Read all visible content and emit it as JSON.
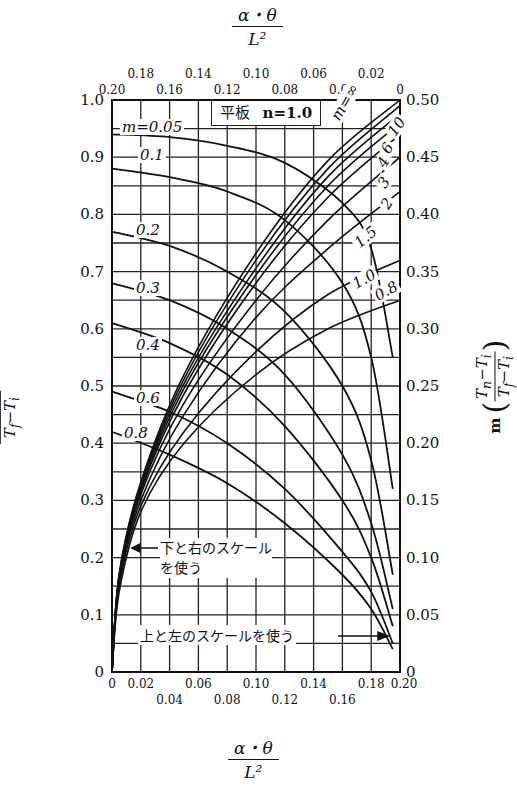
{
  "chart_data": {
    "type": "line",
    "title": "平板  n=1.0",
    "panel_label": "平板",
    "n_label": "n=1.0",
    "xlabel": "α・θ / L²",
    "xlabel_top": "α・θ / L²",
    "ylabel_left": "(Tn − Ti) / (Tf − Ti)",
    "ylabel_right": "m (Tn − Ti) / (Tf − Ti)",
    "x_bottom": {
      "range": [
        0,
        0.2
      ],
      "ticks": [
        "0",
        "0.02",
        "0.04",
        "0.06",
        "0.08",
        "0.10",
        "0.12",
        "0.14",
        "0.16",
        "0.18",
        "0.20"
      ]
    },
    "x_top": {
      "range": [
        0.2,
        0
      ],
      "ticks": [
        "0.20",
        "0.18",
        "0.16",
        "0.14",
        "0.12",
        "0.10",
        "0.08",
        "0.06",
        "0.04",
        "0.02",
        "0"
      ]
    },
    "y_left": {
      "range": [
        0,
        1.0
      ],
      "ticks": [
        "0",
        "0.1",
        "0.2",
        "0.3",
        "0.4",
        "0.5",
        "0.6",
        "0.7",
        "0.8",
        "0.9",
        "1.0"
      ]
    },
    "y_right": {
      "range": [
        0,
        0.5
      ],
      "ticks": [
        "0",
        "0.05",
        "0.10",
        "0.15",
        "0.20",
        "0.25",
        "0.30",
        "0.35",
        "0.40",
        "0.45",
        "0.50"
      ]
    },
    "grid": true,
    "annotations": {
      "bottom_right_scale": "下と右のスケールを使う",
      "top_left_scale": "上と左のスケールを使う"
    },
    "series_top_left": [
      {
        "name": "m=0.05",
        "label": "m=0.05",
        "x_top": [
          0.2,
          0.16,
          0.12,
          0.08,
          0.04,
          0.02,
          0.005
        ],
        "y_left": [
          0.94,
          0.935,
          0.92,
          0.89,
          0.82,
          0.74,
          0.55
        ]
      },
      {
        "name": "m=0.1",
        "label": "0.1",
        "x_top": [
          0.2,
          0.16,
          0.12,
          0.08,
          0.04,
          0.02,
          0.005
        ],
        "y_left": [
          0.88,
          0.865,
          0.84,
          0.79,
          0.68,
          0.55,
          0.32
        ]
      },
      {
        "name": "m=0.2",
        "label": "0.2",
        "x_top": [
          0.2,
          0.16,
          0.12,
          0.08,
          0.04,
          0.02,
          0.005
        ],
        "y_left": [
          0.77,
          0.745,
          0.7,
          0.63,
          0.5,
          0.37,
          0.17
        ]
      },
      {
        "name": "m=0.3",
        "label": "0.3",
        "x_top": [
          0.2,
          0.16,
          0.12,
          0.08,
          0.04,
          0.02,
          0.005
        ],
        "y_left": [
          0.68,
          0.65,
          0.6,
          0.52,
          0.38,
          0.26,
          0.11
        ]
      },
      {
        "name": "m=0.4",
        "label": "0.4",
        "x_top": [
          0.2,
          0.16,
          0.12,
          0.08,
          0.04,
          0.02,
          0.005
        ],
        "y_left": [
          0.61,
          0.575,
          0.52,
          0.43,
          0.3,
          0.2,
          0.08
        ]
      },
      {
        "name": "m=0.6",
        "label": "0.6",
        "x_top": [
          0.2,
          0.16,
          0.12,
          0.08,
          0.04,
          0.02,
          0.005
        ],
        "y_left": [
          0.49,
          0.455,
          0.4,
          0.32,
          0.21,
          0.14,
          0.05
        ]
      },
      {
        "name": "m=0.8",
        "label": "0.8",
        "x_top": [
          0.2,
          0.16,
          0.12,
          0.08,
          0.04,
          0.02,
          0.005
        ],
        "y_left": [
          0.42,
          0.38,
          0.33,
          0.26,
          0.17,
          0.11,
          0.04
        ]
      }
    ],
    "series_bottom_right": [
      {
        "name": "m=0.8",
        "label": "0.8",
        "x": [
          0,
          0.005,
          0.02,
          0.05,
          0.1,
          0.15,
          0.2
        ],
        "y_right": [
          0,
          0.07,
          0.14,
          0.2,
          0.26,
          0.3,
          0.325
        ]
      },
      {
        "name": "m=1.0",
        "label": "1.0",
        "x": [
          0,
          0.005,
          0.02,
          0.05,
          0.1,
          0.15,
          0.2
        ],
        "y_right": [
          0,
          0.075,
          0.145,
          0.21,
          0.28,
          0.33,
          0.36
        ]
      },
      {
        "name": "m=1.5",
        "label": "1.5",
        "x": [
          0,
          0.005,
          0.02,
          0.05,
          0.1,
          0.15,
          0.2
        ],
        "y_right": [
          0,
          0.08,
          0.15,
          0.225,
          0.31,
          0.37,
          0.42
        ]
      },
      {
        "name": "m=2",
        "label": "2",
        "x": [
          0,
          0.005,
          0.02,
          0.05,
          0.1,
          0.15,
          0.2
        ],
        "y_right": [
          0,
          0.08,
          0.155,
          0.235,
          0.325,
          0.395,
          0.45
        ]
      },
      {
        "name": "m=3",
        "label": "3",
        "x": [
          0,
          0.005,
          0.02,
          0.05,
          0.1,
          0.15,
          0.2
        ],
        "y_right": [
          0,
          0.082,
          0.158,
          0.243,
          0.34,
          0.415,
          0.47
        ]
      },
      {
        "name": "m=4",
        "label": "4",
        "x": [
          0,
          0.005,
          0.02,
          0.05,
          0.1,
          0.15,
          0.2
        ],
        "y_right": [
          0,
          0.083,
          0.16,
          0.248,
          0.347,
          0.425,
          0.48
        ]
      },
      {
        "name": "m=6",
        "label": "6",
        "x": [
          0,
          0.005,
          0.02,
          0.05,
          0.1,
          0.15,
          0.2
        ],
        "y_right": [
          0,
          0.084,
          0.162,
          0.252,
          0.353,
          0.433,
          0.488
        ]
      },
      {
        "name": "m=10",
        "label": "10",
        "x": [
          0,
          0.005,
          0.02,
          0.05,
          0.1,
          0.15,
          0.2
        ],
        "y_right": [
          0,
          0.085,
          0.164,
          0.256,
          0.36,
          0.44,
          0.495
        ]
      },
      {
        "name": "m=∞",
        "label": "m=∞",
        "x": [
          0,
          0.005,
          0.02,
          0.05,
          0.1,
          0.15,
          0.2
        ],
        "y_right": [
          0,
          0.086,
          0.166,
          0.26,
          0.366,
          0.447,
          0.5
        ]
      }
    ]
  }
}
